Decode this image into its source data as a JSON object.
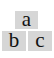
{
  "tiles": [
    {
      "id": "a",
      "label": "a"
    },
    {
      "id": "b",
      "label": "b"
    },
    {
      "id": "c",
      "label": "c"
    }
  ],
  "colors": {
    "tile_bg": "#d6d6d6",
    "text": "#111111",
    "page_bg": "#ffffff"
  }
}
